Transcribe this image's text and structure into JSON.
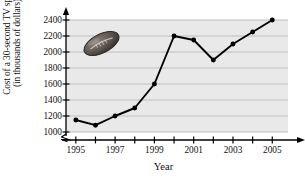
{
  "chart_data": {
    "type": "line",
    "title": "",
    "xlabel": "Year",
    "ylabel": "Cost of a 30-second TV spot (in thousands of dollars)",
    "ylabel_line1": "Cost of a 30-second TV spot",
    "ylabel_line2": "(in thousands of dollars)",
    "x": [
      1995,
      1996,
      1997,
      1998,
      1999,
      2000,
      2001,
      2002,
      2003,
      2004,
      2005
    ],
    "values": [
      1150,
      1085,
      1200,
      1300,
      1600,
      2200,
      2150,
      1900,
      2100,
      2250,
      2400
    ],
    "xtick_values": [
      1995,
      1996,
      1997,
      1998,
      1999,
      2000,
      2001,
      2002,
      2003,
      2004,
      2005
    ],
    "xtick_labels_shown": [
      "1995",
      "1997",
      "1999",
      "2001",
      "2003",
      "2005"
    ],
    "ytick_labels": [
      "1000",
      "1200",
      "1400",
      "1600",
      "1800",
      "2000",
      "2200",
      "2400"
    ],
    "ytick_values": [
      1000,
      1200,
      1400,
      1600,
      1800,
      2000,
      2200,
      2400
    ],
    "ylim": [
      1000,
      2400
    ],
    "xlim": [
      1994.5,
      2005.8
    ],
    "grid": "horizontal",
    "legend": "none",
    "axis_break": "zigzag-below-1000",
    "plot_background": "#e9e9e9",
    "gridline_color": "#b9b9b9",
    "line_color": "#000000",
    "marker": "filled-circle",
    "decoration": "football-icon",
    "football_color": "#5a534e"
  }
}
